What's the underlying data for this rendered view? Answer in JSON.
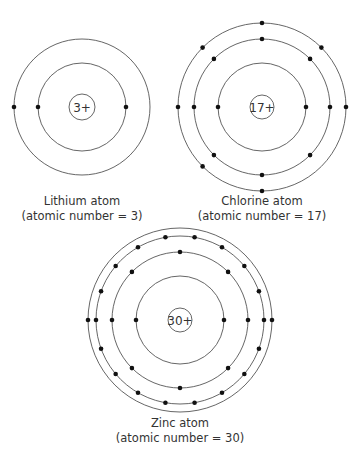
{
  "atoms": [
    {
      "name": "Lithium atom",
      "subtitle": "(atomic number = 3)",
      "nucleus": "3+",
      "cx": 82,
      "cy": 107,
      "nucleus_r": 13,
      "shells": [
        {
          "r": 44,
          "angles": [
            0,
            180
          ]
        },
        {
          "r": 68,
          "angles": [
            180
          ]
        }
      ],
      "label_y": 194
    },
    {
      "name": "Chlorine atom",
      "subtitle": "(atomic number = 17)",
      "nucleus": "17+",
      "cx": 262,
      "cy": 107,
      "nucleus_r": 12,
      "shells": [
        {
          "r": 44,
          "angles": [
            0,
            180
          ]
        },
        {
          "r": 68,
          "angles": [
            0,
            45,
            90,
            135,
            180,
            225,
            270,
            315
          ]
        },
        {
          "r": 84,
          "angles": [
            0,
            45,
            90,
            135,
            180,
            225,
            270
          ]
        }
      ],
      "label_y": 194
    },
    {
      "name": "Zinc atom",
      "subtitle": "(atomic number = 30)",
      "nucleus": "30+",
      "cx": 180,
      "cy": 320,
      "nucleus_r": 12,
      "shells": [
        {
          "r": 44,
          "angles": [
            0,
            180
          ]
        },
        {
          "r": 68,
          "angles": [
            0,
            45,
            90,
            135,
            180,
            225,
            270,
            315
          ]
        },
        {
          "r": 84,
          "angles": [
            0,
            20,
            40,
            60,
            80,
            100,
            120,
            140,
            160,
            180,
            200,
            220,
            240,
            260,
            280,
            300,
            320,
            340
          ]
        },
        {
          "r": 92,
          "angles": [
            0,
            180
          ]
        }
      ],
      "label_y": 416
    }
  ],
  "colors": {
    "line": "#555555",
    "electron": "#111111",
    "text": "#333333"
  }
}
